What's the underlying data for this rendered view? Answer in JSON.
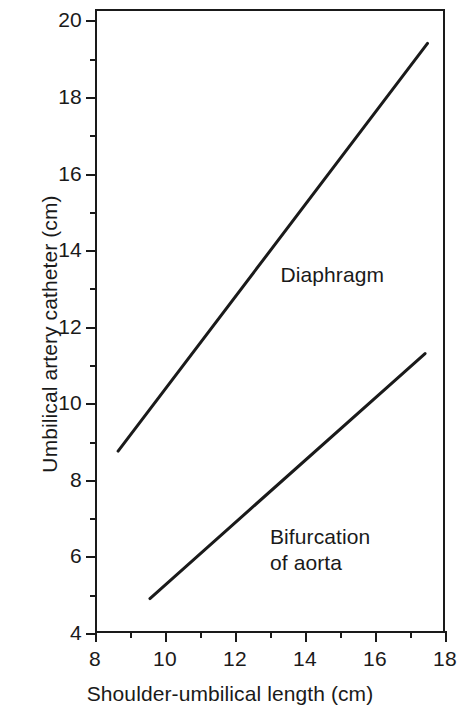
{
  "chart_data": {
    "type": "line",
    "title": "",
    "xlabel": "Shoulder-umbilical length (cm)",
    "ylabel": "Umbilical artery catheter (cm)",
    "xlim": [
      8,
      18
    ],
    "ylim": [
      4,
      20.3
    ],
    "xticks": [
      8,
      10,
      12,
      14,
      16,
      18
    ],
    "xtick_labels": [
      "8",
      "10",
      "12",
      "14",
      "16",
      "18"
    ],
    "xminor_ticks": [
      9,
      11,
      13,
      15,
      17
    ],
    "yticks": [
      4,
      6,
      8,
      10,
      12,
      14,
      16,
      18,
      20
    ],
    "ytick_labels": [
      "4",
      "6",
      "8",
      "10",
      "12",
      "14",
      "16",
      "18",
      "20"
    ],
    "grid": false,
    "legend": "inline-annotation",
    "line_color": "#1a1a1a",
    "frame_color": "#1a1a1a",
    "background": "#ffffff",
    "series": [
      {
        "name": "Diaphragm",
        "label": "Diaphragm",
        "x": [
          8.66,
          17.5
        ],
        "y": [
          8.75,
          19.4
        ],
        "points": [
          [
            8.66,
            8.75
          ],
          [
            17.5,
            19.4
          ]
        ],
        "label_x": 13.3,
        "label_y": 13.35
      },
      {
        "name": "Bifurcation of aorta",
        "label": "Bifurcation\nof aorta",
        "x": [
          9.57,
          17.43
        ],
        "y": [
          4.9,
          11.3
        ],
        "points": [
          [
            9.57,
            4.9
          ],
          [
            17.43,
            11.3
          ]
        ],
        "label_x": 13.0,
        "label_y": 6.5
      }
    ]
  },
  "annotations": {
    "diaphragm_label": "Diaphragm",
    "bifurcation_label_line1": "Bifurcation",
    "bifurcation_label_line2": "of aorta"
  },
  "axes": {
    "x_title": "Shoulder-umbilical length (cm)",
    "y_title": "Umbilical artery catheter (cm)"
  }
}
